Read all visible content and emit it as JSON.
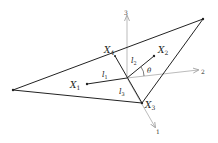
{
  "diagram": {
    "title": "",
    "labels": {
      "x1": "X",
      "x1_sub": "1",
      "x2": "X",
      "x2_sub": "2",
      "x3": "X",
      "x3_sub": "3",
      "x4": "X",
      "x4_sub": "4",
      "l1": "l",
      "l1_sub": "1",
      "l2": "l",
      "l2_sub": "2",
      "l3": "l",
      "l3_sub": "3",
      "theta": "θ",
      "axis1": "1",
      "axis2": "2",
      "axis3": "3"
    },
    "colors": {
      "line": "#222222",
      "axis": "#999999"
    }
  }
}
